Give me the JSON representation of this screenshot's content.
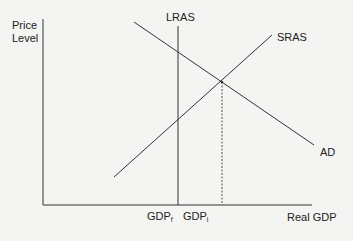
{
  "diagram": {
    "y_axis_label_line1": "Price",
    "y_axis_label_line2": "Level",
    "x_axis_label": "Real GDP",
    "curves": [
      {
        "name": "LRAS",
        "label": "LRAS",
        "type": "vertical"
      },
      {
        "name": "SRAS",
        "label": "SRAS",
        "type": "upward-sloping"
      },
      {
        "name": "AD",
        "label": "AD",
        "type": "downward-sloping"
      }
    ],
    "x_ticks": [
      {
        "base": "GDP",
        "sub": "f"
      },
      {
        "base": "GDP",
        "sub": "i"
      }
    ],
    "colors": {
      "line": "#333333",
      "background": "#f4f4f2"
    }
  }
}
